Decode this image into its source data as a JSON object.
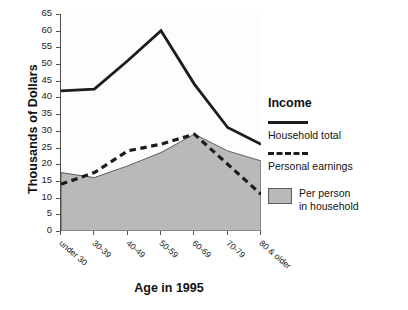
{
  "chart_data": {
    "type": "area",
    "title": "",
    "xlabel": "Age in 1995",
    "ylabel": "Thousands of Dollars",
    "categories": [
      "under 30",
      "30-39",
      "40-49",
      "50-59",
      "60-69",
      "70-79",
      "80 & older"
    ],
    "ylim": [
      0,
      65
    ],
    "yticks": [
      0,
      5,
      10,
      15,
      20,
      25,
      30,
      35,
      40,
      45,
      50,
      55,
      60,
      65
    ],
    "ytick_labels": [
      "0",
      "5",
      "10",
      "15",
      "20",
      "25",
      "30",
      "35",
      "40",
      "45",
      "50",
      "55",
      "60",
      "65"
    ],
    "grid": false,
    "legend_position": "right",
    "series": [
      {
        "name": "Household total",
        "style": "solid-line",
        "color": "#1c1c1c",
        "values": [
          42,
          42.5,
          51,
          60,
          44,
          31,
          26
        ]
      },
      {
        "name": "Personal earnings",
        "style": "dashed-line",
        "color": "#1c1c1c",
        "values": [
          14,
          17.5,
          24,
          26,
          29,
          20,
          11
        ]
      },
      {
        "name": "Per person in household",
        "style": "filled-area",
        "color": "#b9b9b9",
        "values": [
          17.5,
          16,
          19.5,
          23.5,
          29,
          24,
          21
        ]
      }
    ]
  },
  "legend": {
    "title": "Income",
    "entries": [
      {
        "label": "Household total",
        "swatch": "solid-line-swatch"
      },
      {
        "label": "Personal earnings",
        "swatch": "dashed-line-swatch"
      },
      {
        "label_line1": "Per person",
        "label_line2": "in household",
        "swatch": "gray-box-swatch"
      }
    ]
  },
  "axes": {
    "y_title": "Thousands of Dollars",
    "x_title": "Age in 1995"
  }
}
